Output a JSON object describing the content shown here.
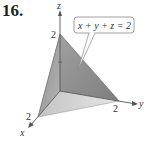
{
  "problem_number": "16.",
  "diagram": {
    "type": "3d-plane",
    "equation_label": "x + y + z = 2",
    "axes": {
      "x": {
        "label": "x",
        "tick": "2"
      },
      "y": {
        "label": "y",
        "tick": "2"
      },
      "z": {
        "label": "z",
        "tick": "2"
      }
    },
    "colors": {
      "face_dark": "#8a8a8a",
      "face_mid": "#a8a8a8",
      "face_light": "#d0d0d0",
      "axis": "#555555",
      "callout_border": "#888888"
    }
  }
}
